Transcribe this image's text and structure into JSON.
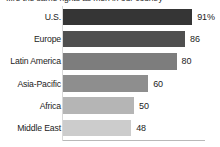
{
  "chart_data": {
    "type": "bar",
    "orientation": "horizontal",
    "title": "...re the same rights as men in our country",
    "xlabel": "",
    "ylabel": "",
    "xlim": [
      0,
      100
    ],
    "grid": false,
    "legend": null,
    "categories": [
      "U.S.",
      "Europe",
      "Latin America",
      "Asia-Pacific",
      "Africa",
      "Middle East"
    ],
    "values": [
      91,
      86,
      80,
      60,
      50,
      48
    ],
    "value_labels": [
      "91%",
      "86",
      "80",
      "60",
      "50",
      "48"
    ],
    "bar_colors": [
      "#353535",
      "#4f4f4f",
      "#7d7d7d",
      "#8e8e8e",
      "#b5b5b5",
      "#cccccc"
    ],
    "axis_color": "#b9b9b9",
    "background": "#ffffff"
  },
  "rows": [
    {
      "label": "U.S.",
      "value": 91,
      "value_label": "91%",
      "color": "#353535"
    },
    {
      "label": "Europe",
      "value": 86,
      "value_label": "86",
      "color": "#4f4f4f"
    },
    {
      "label": "Latin America",
      "value": 80,
      "value_label": "80",
      "color": "#7d7d7d"
    },
    {
      "label": "Asia-Pacific",
      "value": 60,
      "value_label": "60",
      "color": "#8e8e8e"
    },
    {
      "label": "Africa",
      "value": 50,
      "value_label": "50",
      "color": "#b5b5b5"
    },
    {
      "label": "Middle East",
      "value": 48,
      "value_label": "48",
      "color": "#cccccc"
    }
  ]
}
